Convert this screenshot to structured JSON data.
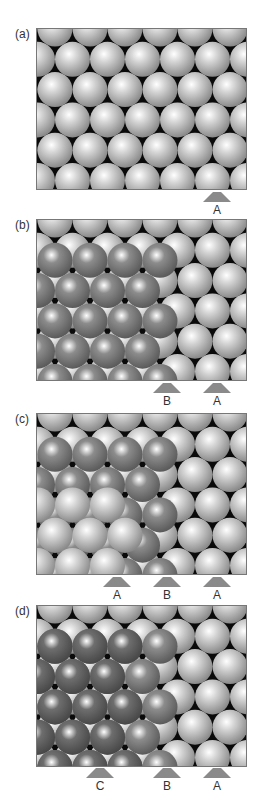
{
  "figure": {
    "colors": {
      "layer_a": "#d4d4d4",
      "layer_b": "#8c8c8c",
      "layer_c": "#6e6e6e",
      "void": "#0a0a0a",
      "marker": "#8a8a8a",
      "border": "#777777"
    },
    "panels": [
      {
        "id": "a",
        "label": "(a)",
        "layers": [
          "A"
        ],
        "markers": [
          {
            "label": "A",
            "x": 217
          }
        ]
      },
      {
        "id": "b",
        "label": "(b)",
        "layers": [
          "A",
          "B"
        ],
        "markers": [
          {
            "label": "B",
            "x": 167
          },
          {
            "label": "A",
            "x": 217
          }
        ]
      },
      {
        "id": "c",
        "label": "(c)",
        "layers": [
          "A",
          "B",
          "A"
        ],
        "markers": [
          {
            "label": "A",
            "x": 117
          },
          {
            "label": "B",
            "x": 167
          },
          {
            "label": "A",
            "x": 217
          }
        ]
      },
      {
        "id": "d",
        "label": "(d)",
        "layers": [
          "A",
          "B",
          "C"
        ],
        "markers": [
          {
            "label": "C",
            "x": 100
          },
          {
            "label": "B",
            "x": 167
          },
          {
            "label": "A",
            "x": 217
          }
        ]
      }
    ]
  }
}
